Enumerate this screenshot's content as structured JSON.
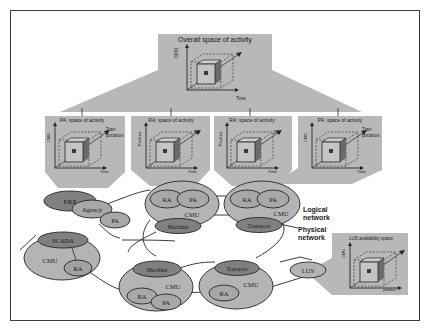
{
  "colors": {
    "panel": "#b8b8b8",
    "panel_dark": "#a8a8a8",
    "ellipse_light": "#b4b4b4",
    "ellipse_mid": "#a2a2a2",
    "ellipse_dark": "#808080",
    "stroke": "#262626",
    "frame": "#3a3a3a"
  },
  "top_panel": {
    "title": "Overall space of activity",
    "y_axis": "CMU",
    "x_axis": "Time"
  },
  "sub_panels": [
    {
      "title": "PA: space of activity",
      "y_axis": "CMU",
      "x_axis": "Time",
      "z_axis_line1": "Tran-",
      "z_axis_line2": "portation"
    },
    {
      "title": "RA: space of activity",
      "y_axis": "Product",
      "x_axis": "Time",
      "z_axis_line1": "PA",
      "z_axis_line2": ""
    },
    {
      "title": "RA: space of activity",
      "y_axis": "Product",
      "x_axis": "Time",
      "z_axis_line1": "PA",
      "z_axis_line2": ""
    },
    {
      "title": "PA: space of activity",
      "y_axis": "CMU",
      "x_axis": "Time",
      "z_axis_line1": "Tran-",
      "z_axis_line2": "portation"
    }
  ],
  "lus_panel": {
    "title": "LUS availability space",
    "y_axis": "CMU",
    "x_axis": "product"
  },
  "network": {
    "erp": "ERP",
    "agency": "Agency",
    "pa_left": "PA",
    "scada": "SCADA",
    "cmu_left": "CMU",
    "ra_left": "RA",
    "top_mid_ra": "RA",
    "top_mid_pa": "PA",
    "top_mid_cmu": "CMU",
    "top_mid_machine": "Machine",
    "top_right_ra": "RA",
    "top_right_pa": "PA",
    "top_right_cmu": "CMU",
    "top_right_transport": "Transport",
    "bot_mid_machine": "Machine",
    "bot_mid_cmu": "CMU",
    "bot_mid_ra": "RA",
    "bot_mid_pa": "PA",
    "bot_right_transport": "Transport",
    "bot_right_cmu": "CMU",
    "bot_right_ra": "RA",
    "lus": "LUS"
  },
  "legend": {
    "logical_line1": "Logical",
    "logical_line2": "network",
    "physical_line1": "Physical",
    "physical_line2": "network"
  }
}
